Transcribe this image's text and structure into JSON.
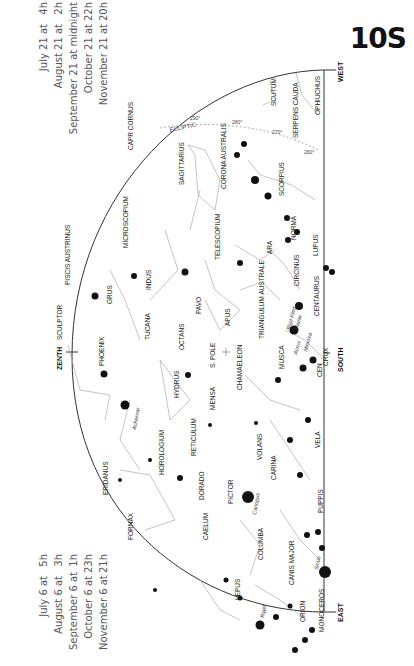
{
  "chart_id": "10S",
  "times_top": [
    {
      "date": "July 21 at",
      "time": "4h"
    },
    {
      "date": "August 21 at",
      "time": "2h"
    },
    {
      "date": "September 21 at midnight",
      "time": ""
    },
    {
      "date": "October 21 at",
      "time": "22h"
    },
    {
      "date": "November 21 at",
      "time": "20h"
    }
  ],
  "times_bottom": [
    {
      "date": "July 6 at",
      "time": "5h"
    },
    {
      "date": "August 6 at",
      "time": "3h"
    },
    {
      "date": "September 6 at",
      "time": "1h"
    },
    {
      "date": "October 6 at",
      "time": "23h"
    },
    {
      "date": "November 6 at",
      "time": "21h"
    }
  ],
  "directions": {
    "west": "WEST",
    "south": "SOUTH",
    "east": "EAST",
    "zenith": "ZENTH"
  },
  "ecliptic": {
    "label": "ECLIPTIC",
    "marks": [
      "290°",
      "280°",
      "270°",
      "260°"
    ]
  },
  "special_labels": {
    "s_pole": "S. POLE"
  },
  "constellations": [
    "SCUTUM",
    "OPHIUCHUS",
    "SERPENS CAUDA",
    "CAPR CORNUS",
    "SAGITTARIUS",
    "CORONA AUSTRALIS",
    "SCORPIUS",
    "NORMA",
    "LUPUS",
    "TELESCOPIUM",
    "ARA",
    "MICROSCOPIUM",
    "PISCIS AUSTRINUS",
    "GRUS",
    "INDUS",
    "PAVO",
    "CIRCINUS",
    "CENTAURUS",
    "TRIANGULUM AUSTRALE",
    "APUS",
    "SCULPTOR",
    "PHOENIX",
    "TUCANA",
    "OCTANS",
    "CHAMAELEON",
    "MUSCA",
    "CRUX",
    "CEN",
    "HYDRUS",
    "MENSA",
    "ERIDANUS",
    "HOROLOGIUM",
    "RETICULUM",
    "DORADO",
    "VOLANS",
    "CARINA",
    "VELA",
    "PICTOR",
    "PUPPIS",
    "FORNAX",
    "CAELUM",
    "COLUMBA",
    "CANIS MAJOR",
    "LEPUS",
    "ORION",
    "MONOCEROS"
  ],
  "stars": [
    "Rigil Kent",
    "Hadar",
    "Mimosa",
    "Acrux",
    "Achernar",
    "Canopus",
    "Sirius",
    "Rigel"
  ]
}
